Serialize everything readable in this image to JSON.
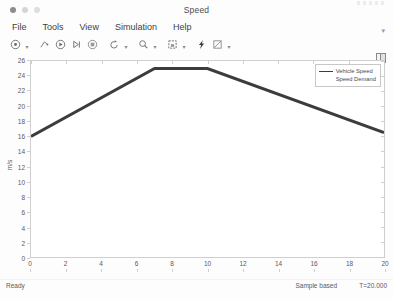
{
  "window": {
    "title": "Speed",
    "controls": [
      "close",
      "minimize",
      "zoom"
    ]
  },
  "menubar": {
    "items": [
      {
        "label": "File",
        "name": "menu-file"
      },
      {
        "label": "Tools",
        "name": "menu-tools"
      },
      {
        "label": "View",
        "name": "menu-view"
      },
      {
        "label": "Simulation",
        "name": "menu-simulation"
      },
      {
        "label": "Help",
        "name": "menu-help"
      }
    ],
    "overflow_caret": "▾"
  },
  "toolbar": {
    "items": [
      {
        "name": "print-icon",
        "caret": true
      },
      {
        "name": "configuration-properties-icon",
        "caret": false
      },
      {
        "name": "run-icon",
        "caret": false
      },
      {
        "name": "step-forward-icon",
        "caret": false
      },
      {
        "name": "stop-icon",
        "caret": false
      },
      {
        "name": "restore-view-icon",
        "caret": true
      },
      {
        "name": "zoom-icon",
        "caret": true
      },
      {
        "name": "save-layout-icon",
        "caret": true
      },
      {
        "name": "trigger-icon",
        "caret": false
      },
      {
        "name": "measurements-icon",
        "caret": true
      }
    ]
  },
  "chart_data": {
    "type": "line",
    "title": "",
    "xlabel": "",
    "ylabel": "m/s",
    "xlim": [
      0,
      20
    ],
    "ylim": [
      0,
      26
    ],
    "xticks": [
      0,
      2,
      4,
      6,
      8,
      10,
      12,
      14,
      16,
      18,
      20
    ],
    "yticks": [
      0,
      2,
      4,
      6,
      8,
      10,
      12,
      14,
      16,
      18,
      20,
      22,
      24,
      26
    ],
    "grid": false,
    "legend_position": "top-right",
    "legend": [
      "Vehicle Speed",
      "Speed Demand"
    ],
    "series": [
      {
        "name": "Vehicle Speed",
        "color": "#3c3c3c",
        "x": [
          0,
          7,
          10,
          20
        ],
        "y": [
          16.0,
          25.0,
          25.0,
          16.5
        ]
      },
      {
        "name": "Speed Demand",
        "color": "#3c3c3c",
        "x": [
          0,
          7,
          10,
          20
        ],
        "y": [
          16.0,
          25.0,
          25.0,
          16.5
        ]
      }
    ]
  },
  "statusbar": {
    "ready": "Ready",
    "sample_mode": "Sample based",
    "time": "T=20.000"
  }
}
